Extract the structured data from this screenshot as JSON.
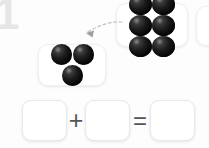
{
  "page": {
    "number_watermark": "1",
    "background_color": "#fdfdfd"
  },
  "ball_color": "#141414",
  "groups": [
    {
      "id": "group-six",
      "name": "six-ball-group",
      "count": 6,
      "rows": 2,
      "columns": 3,
      "label": "6"
    },
    {
      "id": "group-three",
      "name": "three-ball-group",
      "count": 3,
      "rows": 1,
      "columns": 3,
      "label": "3"
    }
  ],
  "partial_group": {
    "name": "off-screen-group",
    "label": ""
  },
  "arrow": {
    "name": "drag-arrow",
    "style": "dashed-curved",
    "color": "#b8b8b8",
    "direction": "right-to-left",
    "label": ""
  },
  "equation": {
    "operators": {
      "plus": "+",
      "equals": "="
    },
    "boxes": [
      {
        "name": "addend-1-box",
        "value": "",
        "placeholder": ""
      },
      {
        "name": "addend-2-box",
        "value": "",
        "placeholder": ""
      },
      {
        "name": "sum-box",
        "value": "",
        "placeholder": ""
      }
    ]
  }
}
